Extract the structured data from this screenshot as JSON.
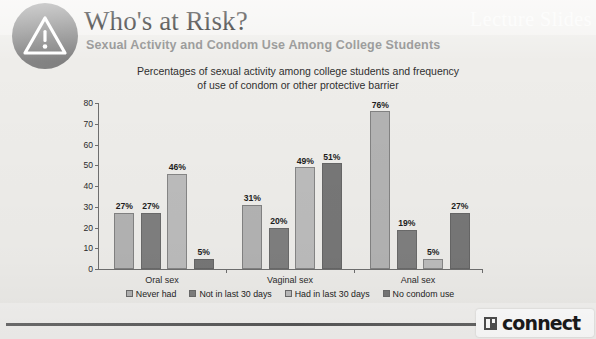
{
  "header": {
    "icon": "warning-triangle-icon",
    "title": "Who's at Risk?",
    "subtitle": "Sexual Activity and Condom Use Among College Students",
    "ghost_text": "Lecture Slides"
  },
  "footer": {
    "logo_text": "connect",
    "logo_mark": "connect-logo-icon"
  },
  "colors": {
    "badge": "#8c8c8c",
    "subtitle": "#8d8d8d",
    "series_1": "#b3b3b3",
    "series_2": "#7f7f7f",
    "series_3": "#bcbcbc",
    "series_4": "#777777",
    "axis": "#6f6f6f",
    "background": "#f2f1ef"
  },
  "chart_data": {
    "type": "bar",
    "title": "Percentages of sexual activity among college students and frequency of use of condom or other protective barrier",
    "title_line_1": "Percentages of sexual activity among college students and frequency",
    "title_line_2": "of use of condom or other protective barrier",
    "xlabel": "",
    "ylabel": "",
    "ylim": [
      0,
      80
    ],
    "yticks": [
      "0",
      "10",
      "20",
      "30",
      "40",
      "50",
      "60",
      "70",
      "80"
    ],
    "grid": false,
    "legend_position": "bottom",
    "categories": [
      "Oral sex",
      "Vaginal sex",
      "Anal sex"
    ],
    "series": [
      {
        "name": "Never had",
        "color": "#b3b3b3",
        "values": [
          27,
          31,
          76
        ],
        "labels": [
          "27%",
          "31%",
          "76%"
        ]
      },
      {
        "name": "Not in last 30 days",
        "color": "#7f7f7f",
        "values": [
          27,
          20,
          19
        ],
        "labels": [
          "27%",
          "20%",
          "19%"
        ]
      },
      {
        "name": "Had in last 30 days",
        "color": "#bcbcbc",
        "values": [
          46,
          49,
          5
        ],
        "labels": [
          "46%",
          "49%",
          "5%"
        ]
      },
      {
        "name": "No condom use",
        "color": "#777777",
        "values": [
          5,
          51,
          27
        ],
        "labels": [
          "5%",
          "51%",
          "27%"
        ]
      }
    ]
  }
}
